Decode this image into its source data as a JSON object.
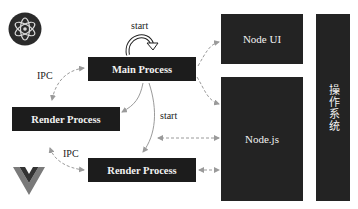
{
  "diagram": {
    "boxes": {
      "main_process": "Main Process",
      "render_process_left": "Render Process",
      "render_process_bottom": "Render Process",
      "node_ui": "Node UI",
      "nodejs": "Node.js",
      "os": "操作系统"
    },
    "labels": {
      "start_top": "start",
      "start_middle": "start",
      "ipc_top": "IPC",
      "ipc_bottom": "IPC"
    },
    "logos": {
      "top_left": "electron-logo-icon",
      "bottom_left": "vue-logo-icon"
    },
    "colors": {
      "box_fill": "#1c1c1c",
      "box_text": "#f2f2f2",
      "arrow": "#9a9a9a",
      "background": "#ffffff"
    }
  }
}
